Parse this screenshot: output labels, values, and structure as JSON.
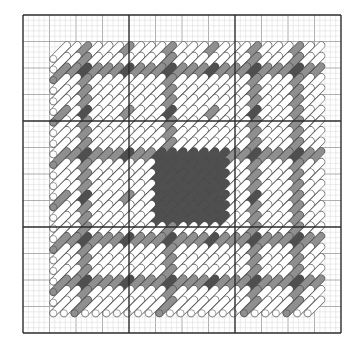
{
  "document": {
    "title": "Needlepoint Stitch Pattern Chart",
    "kind": "stitch-chart"
  },
  "canvas": {
    "width": 362,
    "height": 350,
    "background": "#ffffff"
  },
  "grid": {
    "origin_x": 23,
    "origin_y": 15,
    "cols": 60,
    "rows": 60,
    "cell": 5.3,
    "minor_color": "#d9d9d9",
    "medium_color": "#9a9a9a",
    "heavy_color": "#2b2b2b",
    "minor_every": 1,
    "medium_every": 5,
    "heavy_every": 20,
    "minor_width": 0.5,
    "medium_width": 0.8,
    "heavy_width": 1.4
  },
  "palette": {
    "white": "#ffffff",
    "light_gray": "#f2f2f2",
    "medium_gray": "#8f8f8f",
    "dark_gray": "#4f4f4f",
    "outline": "#4a4a4a",
    "stitch_outline_light": "#555555"
  },
  "stitch": {
    "shape": "diagonal-slant-with-round-cap",
    "direction": "bottom-left-to-top-right",
    "span_cells": 4,
    "thickness_cells": 1.45,
    "step_cells": 2
  },
  "pattern": {
    "inner_origin_col": 5,
    "inner_origin_row": 5,
    "inner_cols": 50,
    "inner_rows": 50,
    "band_positions_cols": [
      0,
      12,
      24,
      36,
      48
    ],
    "band_positions_rows": [
      0,
      12,
      24,
      36,
      48
    ],
    "description": "Symmetric plaid / tartan motif. White slanted stitches form the field; medium-gray bands cross the field horizontally and vertically at regular intervals; dark-gray stitches mark the band intersections and a solid dark-gray square occupies the centre.",
    "legend": [
      {
        "symbol": "white-slant",
        "color": "#ffffff",
        "label": "White"
      },
      {
        "symbol": "medium-slant",
        "color": "#8f8f8f",
        "label": "Medium Gray"
      },
      {
        "symbol": "dark-slant",
        "color": "#4f4f4f",
        "label": "Dark Gray"
      }
    ]
  },
  "chart_data": {
    "type": "heatmap",
    "xlabel": "",
    "ylabel": "",
    "grid": true,
    "legend": [
      "White",
      "Medium Gray",
      "Dark Gray"
    ],
    "legend_position": "none",
    "colors": [
      "#ffffff",
      "#8f8f8f",
      "#4f4f4f"
    ],
    "cols": 25,
    "rows": 25,
    "value_map": {
      "0": "white",
      "1": "medium gray",
      "2": "dark gray"
    },
    "matrix": [
      [
        0,
        0,
        1,
        0,
        0,
        0,
        1,
        0,
        0,
        0,
        1,
        0,
        0,
        0,
        1,
        0,
        0,
        0,
        1,
        0,
        0,
        0,
        1,
        0,
        0
      ],
      [
        0,
        0,
        1,
        0,
        0,
        0,
        0,
        0,
        0,
        0,
        1,
        0,
        0,
        0,
        0,
        0,
        0,
        0,
        1,
        0,
        0,
        0,
        1,
        0,
        0
      ],
      [
        1,
        1,
        2,
        1,
        1,
        1,
        2,
        1,
        1,
        1,
        2,
        1,
        1,
        1,
        2,
        1,
        1,
        1,
        2,
        1,
        1,
        1,
        2,
        1,
        1
      ],
      [
        0,
        0,
        1,
        0,
        0,
        0,
        0,
        0,
        0,
        0,
        1,
        0,
        0,
        0,
        0,
        0,
        0,
        0,
        1,
        0,
        0,
        0,
        1,
        0,
        0
      ],
      [
        0,
        0,
        1,
        0,
        0,
        0,
        0,
        0,
        0,
        0,
        1,
        0,
        0,
        0,
        0,
        0,
        0,
        0,
        1,
        0,
        0,
        0,
        1,
        0,
        0
      ],
      [
        0,
        0,
        1,
        0,
        0,
        0,
        0,
        0,
        0,
        0,
        1,
        0,
        0,
        0,
        0,
        0,
        0,
        0,
        1,
        0,
        0,
        0,
        1,
        0,
        0
      ],
      [
        1,
        0,
        2,
        0,
        0,
        0,
        1,
        0,
        0,
        0,
        2,
        0,
        0,
        0,
        1,
        0,
        0,
        0,
        2,
        0,
        0,
        0,
        1,
        0,
        0
      ],
      [
        0,
        0,
        1,
        0,
        0,
        0,
        0,
        0,
        0,
        0,
        1,
        0,
        0,
        0,
        0,
        0,
        0,
        0,
        1,
        0,
        0,
        0,
        1,
        0,
        0
      ],
      [
        0,
        0,
        1,
        0,
        0,
        0,
        0,
        0,
        0,
        0,
        1,
        0,
        0,
        0,
        0,
        0,
        0,
        0,
        1,
        0,
        0,
        0,
        1,
        0,
        0
      ],
      [
        0,
        0,
        1,
        0,
        0,
        0,
        0,
        0,
        0,
        0,
        1,
        0,
        0,
        0,
        0,
        0,
        0,
        0,
        1,
        0,
        0,
        0,
        1,
        0,
        0
      ],
      [
        1,
        1,
        2,
        1,
        1,
        1,
        2,
        1,
        1,
        2,
        2,
        2,
        2,
        2,
        2,
        2,
        1,
        1,
        2,
        1,
        1,
        1,
        2,
        1,
        1
      ],
      [
        0,
        0,
        1,
        0,
        0,
        0,
        0,
        0,
        0,
        2,
        2,
        2,
        2,
        2,
        2,
        2,
        0,
        0,
        1,
        0,
        0,
        0,
        1,
        0,
        0
      ],
      [
        0,
        0,
        1,
        0,
        0,
        0,
        0,
        0,
        0,
        2,
        2,
        2,
        2,
        2,
        2,
        2,
        0,
        0,
        1,
        0,
        0,
        0,
        1,
        0,
        0
      ],
      [
        0,
        0,
        1,
        0,
        0,
        0,
        0,
        0,
        0,
        2,
        2,
        2,
        2,
        2,
        2,
        2,
        0,
        0,
        1,
        0,
        0,
        0,
        1,
        0,
        0
      ],
      [
        1,
        0,
        2,
        0,
        0,
        0,
        1,
        0,
        0,
        2,
        2,
        2,
        2,
        2,
        2,
        2,
        0,
        0,
        2,
        0,
        0,
        0,
        1,
        0,
        0
      ],
      [
        0,
        0,
        1,
        0,
        0,
        0,
        0,
        0,
        0,
        2,
        2,
        2,
        2,
        2,
        2,
        2,
        0,
        0,
        1,
        0,
        0,
        0,
        1,
        0,
        0
      ],
      [
        0,
        0,
        1,
        0,
        0,
        0,
        0,
        0,
        0,
        2,
        2,
        2,
        2,
        2,
        2,
        2,
        0,
        0,
        1,
        0,
        0,
        0,
        1,
        0,
        0
      ],
      [
        0,
        0,
        1,
        0,
        0,
        0,
        0,
        0,
        0,
        0,
        1,
        0,
        0,
        0,
        0,
        0,
        0,
        0,
        1,
        0,
        0,
        0,
        1,
        0,
        0
      ],
      [
        1,
        1,
        2,
        1,
        1,
        1,
        2,
        1,
        1,
        1,
        2,
        1,
        1,
        1,
        2,
        1,
        1,
        1,
        2,
        1,
        1,
        1,
        2,
        1,
        1
      ],
      [
        0,
        0,
        1,
        0,
        0,
        0,
        0,
        0,
        0,
        0,
        1,
        0,
        0,
        0,
        0,
        0,
        0,
        0,
        1,
        0,
        0,
        0,
        1,
        0,
        0
      ],
      [
        0,
        0,
        1,
        0,
        0,
        0,
        0,
        0,
        0,
        0,
        1,
        0,
        0,
        0,
        0,
        0,
        0,
        0,
        1,
        0,
        0,
        0,
        1,
        0,
        0
      ],
      [
        0,
        0,
        1,
        0,
        0,
        0,
        0,
        0,
        0,
        0,
        1,
        0,
        0,
        0,
        0,
        0,
        0,
        0,
        1,
        0,
        0,
        0,
        1,
        0,
        0
      ],
      [
        1,
        1,
        2,
        1,
        1,
        1,
        2,
        1,
        1,
        1,
        2,
        1,
        1,
        1,
        2,
        1,
        1,
        1,
        2,
        1,
        1,
        1,
        2,
        1,
        1
      ],
      [
        0,
        0,
        1,
        0,
        0,
        0,
        0,
        0,
        0,
        0,
        1,
        0,
        0,
        0,
        0,
        0,
        0,
        0,
        1,
        0,
        0,
        0,
        1,
        0,
        0
      ],
      [
        0,
        0,
        1,
        0,
        0,
        0,
        0,
        0,
        0,
        0,
        1,
        0,
        0,
        0,
        0,
        0,
        0,
        0,
        1,
        0,
        0,
        0,
        1,
        0,
        0
      ]
    ]
  }
}
